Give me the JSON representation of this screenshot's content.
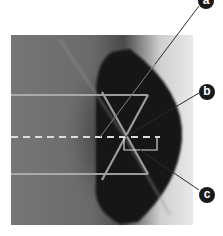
{
  "figure": {
    "labels": [
      {
        "id": "a",
        "text": "a"
      },
      {
        "id": "b",
        "text": "b"
      },
      {
        "id": "c",
        "text": "c"
      }
    ],
    "colors": {
      "background": "#ffffff",
      "photo_bg": "#6f6f6f",
      "block": "#161616",
      "beam": "#b9b9b9",
      "normal_line": "#dddddd",
      "leader_line": "#2a2a2a",
      "badge": "#1a1a1a"
    }
  }
}
